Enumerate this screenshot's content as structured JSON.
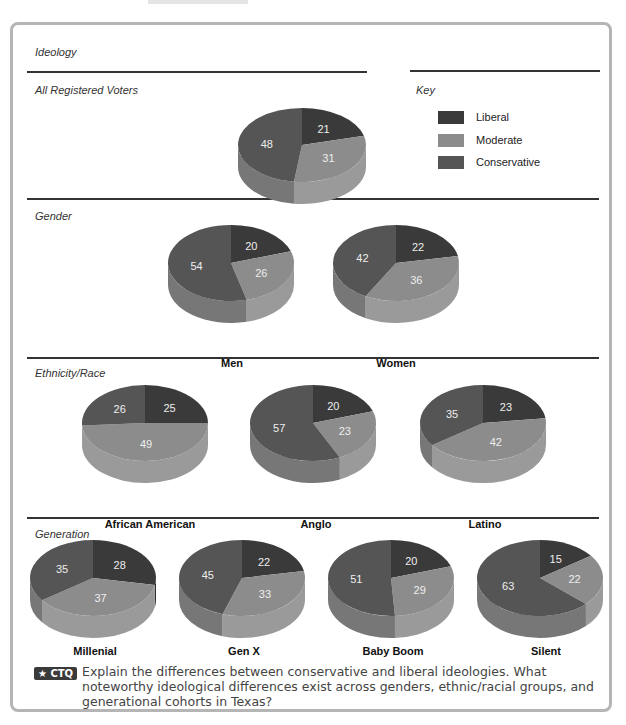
{
  "figure": {
    "title": "Ideology",
    "ctq_badge": "★ CTQ",
    "ctq_text": "Explain the differences between conservative and liberal ideologies. What noteworthy ideological differences exist across genders, ethnic/racial groups, and generational cohorts in Texas?"
  },
  "key": {
    "title": "Key",
    "items": [
      {
        "label": "Liberal",
        "color": "#3a3a3a"
      },
      {
        "label": "Moderate",
        "color": "#8c8c8c"
      },
      {
        "label": "Conservative",
        "color": "#555555"
      }
    ]
  },
  "sections": {
    "all": {
      "title": "All Registered Voters"
    },
    "gender": {
      "title": "Gender"
    },
    "ethnicity": {
      "title": "Ethnicity/Race"
    },
    "generation": {
      "title": "Generation"
    }
  },
  "chart_data": {
    "type": "pie",
    "title": "Ideology",
    "series_order": [
      "Liberal",
      "Moderate",
      "Conservative"
    ],
    "legend_position": "right-top",
    "pies": [
      {
        "group": "All Registered Voters",
        "label": "",
        "values": {
          "Liberal": 21,
          "Moderate": 31,
          "Conservative": 48
        }
      },
      {
        "group": "Gender",
        "label": "Men",
        "values": {
          "Liberal": 20,
          "Moderate": 26,
          "Conservative": 54
        }
      },
      {
        "group": "Gender",
        "label": "Women",
        "values": {
          "Liberal": 22,
          "Moderate": 36,
          "Conservative": 42
        }
      },
      {
        "group": "Ethnicity/Race",
        "label": "African American",
        "values": {
          "Liberal": 25,
          "Moderate": 49,
          "Conservative": 26
        }
      },
      {
        "group": "Ethnicity/Race",
        "label": "Anglo",
        "values": {
          "Liberal": 20,
          "Moderate": 23,
          "Conservative": 57
        }
      },
      {
        "group": "Ethnicity/Race",
        "label": "Latino",
        "values": {
          "Liberal": 23,
          "Moderate": 42,
          "Conservative": 35
        }
      },
      {
        "group": "Generation",
        "label": "Millenial",
        "values": {
          "Liberal": 28,
          "Moderate": 37,
          "Conservative": 35
        }
      },
      {
        "group": "Generation",
        "label": "Gen X",
        "values": {
          "Liberal": 22,
          "Moderate": 33,
          "Conservative": 45
        }
      },
      {
        "group": "Generation",
        "label": "Baby Boom",
        "values": {
          "Liberal": 20,
          "Moderate": 29,
          "Conservative": 51
        }
      },
      {
        "group": "Generation",
        "label": "Silent",
        "values": {
          "Liberal": 15,
          "Moderate": 22,
          "Conservative": 63
        }
      }
    ]
  }
}
